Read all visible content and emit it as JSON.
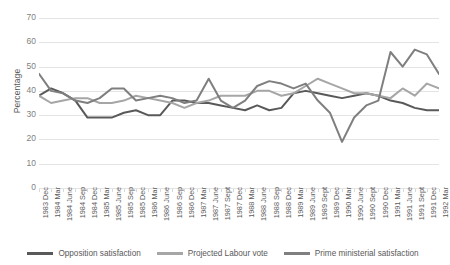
{
  "chart_data": {
    "type": "line",
    "title": "",
    "xlabel": "",
    "ylabel": "Percentage",
    "ylim": [
      0,
      70
    ],
    "ytick_step": 10,
    "yticks": [
      70,
      60,
      50,
      40,
      30,
      20,
      10,
      0
    ],
    "grid": true,
    "legend_position": "bottom",
    "categories": [
      "1983 Dec",
      "1984 Mar",
      "1984 June",
      "1984 Sep",
      "1984 Dec",
      "1985 Mar",
      "1985 June",
      "1985 Sep",
      "1985 Dec",
      "1986 Mar",
      "1986 June",
      "1986 Sep",
      "1986 Dec",
      "1987 Mar",
      "1987 June",
      "1987 Sept",
      "1987 Dec",
      "1988 Mar",
      "1988 June",
      "1988 Sep",
      "1988 Dec",
      "1989 Mar",
      "1989 June",
      "1989 Sept",
      "1989 Dec",
      "1990 Mar",
      "1990 June",
      "1990 Sept",
      "1990 Dec",
      "1991 Mar",
      "1991 June",
      "1991 Sept",
      "1991 Dec",
      "1992 Mar"
    ],
    "series": [
      {
        "name": "Opposition satisfaction",
        "color": "#595959",
        "values": [
          38,
          41,
          39,
          36,
          29,
          29,
          29,
          31,
          32,
          30,
          30,
          36,
          36,
          35,
          35,
          34,
          33,
          32,
          34,
          32,
          33,
          39,
          40,
          39,
          38,
          37,
          38,
          39,
          38,
          36,
          35,
          33,
          32,
          32
        ]
      },
      {
        "name": "Projected Labour vote",
        "color": "#a6a6a6",
        "values": [
          38,
          35,
          36,
          37,
          37,
          35,
          35,
          36,
          38,
          37,
          36,
          35,
          33,
          35,
          36,
          38,
          38,
          38,
          40,
          40,
          38,
          39,
          42,
          45,
          43,
          41,
          39,
          39,
          38,
          37,
          41,
          38,
          43,
          41
        ]
      },
      {
        "name": "Prime ministerial satisfaction",
        "color": "#7f7f7f",
        "values": [
          47,
          40,
          39,
          36,
          35,
          37,
          41,
          41,
          36,
          37,
          38,
          37,
          35,
          36,
          45,
          36,
          33,
          36,
          42,
          44,
          43,
          41,
          43,
          36,
          31,
          19,
          29,
          34,
          36,
          56,
          50,
          57,
          55,
          47
        ]
      }
    ]
  }
}
